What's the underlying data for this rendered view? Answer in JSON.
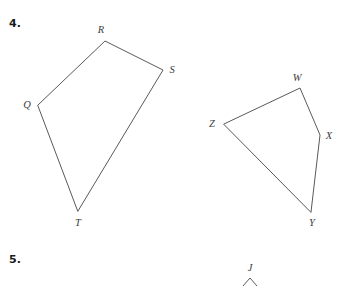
{
  "page": {
    "background_color": "#ffffff",
    "ink_color": "#595959",
    "label_color": "#3d3d3d",
    "width": 338,
    "height": 286
  },
  "problems": [
    {
      "number": "4.",
      "figures": [
        {
          "name": "quadrilateral-qrst",
          "shape": "quadrilateral",
          "closed": true,
          "vertices": [
            {
              "label": "Q",
              "x": 38,
              "y": 105,
              "label_x": 27,
              "label_y": 108
            },
            {
              "label": "R",
              "x": 105,
              "y": 41,
              "label_x": 101,
              "label_y": 33
            },
            {
              "label": "S",
              "x": 163,
              "y": 70,
              "label_x": 170,
              "label_y": 73
            },
            {
              "label": "T",
              "x": 78,
              "y": 211,
              "label_x": 74,
              "label_y": 226
            }
          ],
          "path": "M 38 105 L 105 41 L 163 70 L 78 211 Z"
        },
        {
          "name": "quadrilateral-wxyz",
          "shape": "quadrilateral",
          "closed": true,
          "vertices": [
            {
              "label": "Z",
              "x": 224,
              "y": 124,
              "label_x": 211,
              "label_y": 127
            },
            {
              "label": "W",
              "x": 300,
              "y": 88,
              "label_x": 294,
              "label_y": 81
            },
            {
              "label": "X",
              "x": 320,
              "y": 135,
              "label_x": 327,
              "label_y": 139
            },
            {
              "label": "Y",
              "x": 311,
              "y": 212,
              "label_x": 307,
              "label_y": 226
            }
          ],
          "path": "M 224 124 L 300 88 L 320 135 L 311 212 Z"
        }
      ]
    },
    {
      "number": "5.",
      "figures": [
        {
          "name": "angle-j-partial",
          "shape": "angle",
          "closed": false,
          "clipped_by_page_edge": true,
          "vertices": [
            {
              "label": "J",
              "x": 250,
              "y": 279,
              "label_x": 246,
              "label_y": 271
            }
          ],
          "path": "M 243 286 L 250 278 L 257 286"
        }
      ]
    }
  ]
}
